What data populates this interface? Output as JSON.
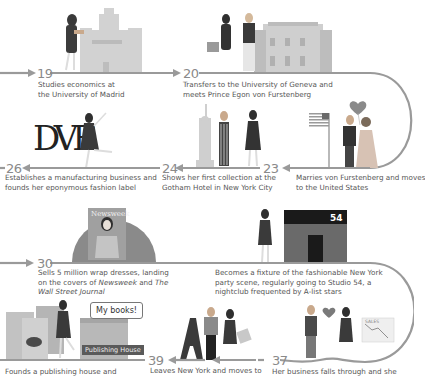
{
  "timeline": {
    "line_color": "#9a9a9a",
    "events": [
      {
        "age": "19",
        "text": "Studies economics at the University of Madrid",
        "lines": [
          "Studies economics at",
          "the University of Madrid"
        ]
      },
      {
        "age": "20",
        "text": "Transfers to the University of Geneva and meets Prince Egon von Furstenberg",
        "lines": [
          "Transfers to the University of Geneva and",
          "meets Prince Egon von Furstenberg"
        ]
      },
      {
        "age": "23",
        "text": "Marries von Furstenberg and moves to the United States",
        "lines": [
          "Marries von Furstenberg and moves",
          "to the United States"
        ]
      },
      {
        "age": "24",
        "text": "Shows her first collection at the Gotham Hotel in New York City",
        "lines": [
          "Shows her first collection at the",
          "Gotham Hotel in New York City"
        ]
      },
      {
        "age": "26",
        "text": "Establishes a manufacturing business and founds her eponymous fashion label",
        "lines": [
          "Establishes a manufacturing business and",
          "founds her eponymous fashion label"
        ]
      },
      {
        "age": "30",
        "text": "Sells 5 million wrap dresses, landing on the covers of Newsweek and The Wall Street Journal",
        "line1": "Sells 5 million wrap dresses, landing",
        "line2_pre": "on the covers of ",
        "line2_italic1": "Newsweek",
        "line2_mid": " and ",
        "line2_italic2": "The",
        "line3_italic": "Wall Street Journal"
      },
      {
        "age": "",
        "text": "Becomes a fixture of the fashionable New York party scene, regularly going to Studio 54, a nightclub frequented by A-list stars",
        "lines": [
          "Becomes a fixture of the fashionable New York",
          "party scene, regularly going to Studio 54, a",
          "nightclub frequented by A-list stars"
        ]
      },
      {
        "age": "37",
        "text": "Her business falls through and she",
        "lines": [
          "Her business falls through and she"
        ]
      },
      {
        "age": "39",
        "text": "Leaves New York and moves to",
        "lines": [
          "Leaves New York and moves to"
        ]
      },
      {
        "age": "",
        "text": "Founds a publishing house and",
        "lines": [
          "Founds a publishing house and"
        ]
      }
    ]
  },
  "illustrations": {
    "logo_text": "DVF",
    "magazine_title": "Newsweek",
    "club_sign": "54",
    "speech_bubble": "My books!",
    "publishing_sign": "Publishing House",
    "sales_chart_label": "SALES"
  }
}
